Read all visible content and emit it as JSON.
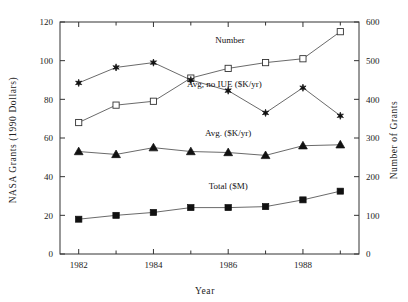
{
  "chart_data": {
    "type": "line",
    "title": "",
    "xlabel": "Year",
    "ylabel": "NASA Grants (1990 Dollars)",
    "y2label": "Number of Grants",
    "x": [
      1982,
      1983,
      1984,
      1985,
      1986,
      1987,
      1988,
      1989
    ],
    "xlim": [
      1981.5,
      1989.5
    ],
    "ylim": [
      0,
      120
    ],
    "y2lim": [
      0,
      600
    ],
    "xticks": [
      1982,
      1984,
      1986,
      1988
    ],
    "xtick_labels": [
      "1982",
      "1984",
      "1986",
      "1988"
    ],
    "xminor_ticks": [
      1983,
      1985,
      1987,
      1989
    ],
    "yticks": [
      0,
      20,
      40,
      60,
      80,
      100,
      120
    ],
    "ytick_labels": [
      "0",
      "20",
      "40",
      "60",
      "80",
      "100",
      "120"
    ],
    "y2ticks": [
      0,
      100,
      200,
      300,
      400,
      500,
      600
    ],
    "y2tick_labels": [
      "0",
      "100",
      "200",
      "300",
      "400",
      "500",
      "600"
    ],
    "grid": false,
    "legend": "inline-annotations",
    "series": [
      {
        "name": "Number",
        "label": "Number",
        "axis": "right",
        "marker": "open-square",
        "color": "#333333",
        "values": [
          340,
          385,
          395,
          455,
          480,
          495,
          505,
          575
        ],
        "label_x": 1986.05,
        "label_y_right": 545
      },
      {
        "name": "Avg, no IUE ($K/yr)",
        "label": "Avg,  no IUE ($K/yr)",
        "axis": "left",
        "marker": "star",
        "color": "#333333",
        "values": [
          88.5,
          96.5,
          99.0,
          90.0,
          84.5,
          73.0,
          86.0,
          71.5
        ],
        "label_x": 1985.9,
        "label_y_left": 86.5
      },
      {
        "name": "Avg. ($K/yr)",
        "label": "Avg. ($K/yr)",
        "axis": "left",
        "marker": "filled-triangle",
        "color": "#111111",
        "values": [
          53.0,
          51.5,
          55.0,
          53.0,
          52.5,
          51.0,
          56.0,
          56.5
        ],
        "label_x": 1986.0,
        "label_y_left": 61.0
      },
      {
        "name": "Total ($M)",
        "label": "Total ($M)",
        "axis": "left",
        "marker": "filled-square",
        "color": "#111111",
        "values": [
          18.0,
          20.0,
          21.5,
          24.0,
          24.0,
          24.5,
          28.0,
          32.5
        ],
        "label_x": 1986.0,
        "label_y_left": 33.5
      }
    ]
  }
}
